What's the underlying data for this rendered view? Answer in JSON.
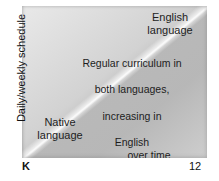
{
  "figure": {
    "title_cut": "",
    "axes": {
      "y_label": "Daily/weekly schedule",
      "x_ticks": [
        "K",
        "12"
      ]
    },
    "regions": {
      "top_right_label": "English\nlanguage",
      "bottom_left_label": "Native\nlanguage",
      "center_label_lines": [
        "Regular curriculum in",
        "both languages,",
        "increasing in",
        "English"
      ],
      "center_label_last_line": "over time"
    }
  },
  "chart_data": {
    "type": "area",
    "title": "",
    "xlabel": "",
    "ylabel": "Daily/weekly schedule",
    "x": [
      "K",
      "12"
    ],
    "xlim": [
      "K",
      "12"
    ],
    "ylim": [
      0,
      100
    ],
    "grid": false,
    "legend_position": "none",
    "series": [
      {
        "name": "Native language",
        "values": [
          100,
          0
        ],
        "color": "#cfcfcf"
      },
      {
        "name": "English language",
        "values": [
          0,
          100
        ],
        "color": "#adadad"
      }
    ],
    "annotations": [
      {
        "text": "English language",
        "position": "top-right"
      },
      {
        "text": "Native language",
        "position": "bottom-left"
      },
      {
        "text": "Regular curriculum in both languages, increasing in English over time",
        "position": "center"
      }
    ]
  }
}
